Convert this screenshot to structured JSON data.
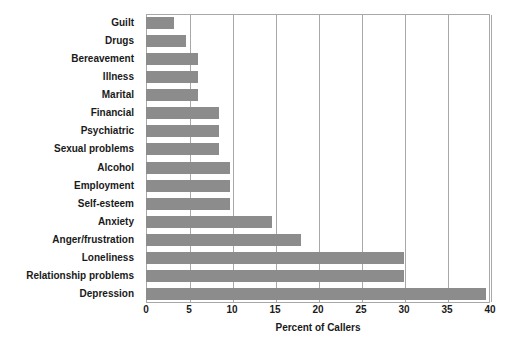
{
  "chart_data": {
    "type": "bar",
    "orientation": "horizontal",
    "title": "",
    "xlabel": "Percent of Callers",
    "ylabel": "",
    "xlim": [
      0,
      40
    ],
    "xticks": [
      0,
      5,
      10,
      15,
      20,
      25,
      30,
      35,
      40
    ],
    "grid": "vertical",
    "legend": "none",
    "bar_color": "#8c8c8c",
    "categories": [
      "Guilt",
      "Drugs",
      "Bereavement",
      "Illness",
      "Marital",
      "Financial",
      "Psychiatric",
      "Sexual problems",
      "Alcohol",
      "Employment",
      "Self-esteem",
      "Anxiety",
      "Anger/frustration",
      "Loneliness",
      "Relationship problems",
      "Depression"
    ],
    "values": [
      3.3,
      4.7,
      6.0,
      6.0,
      6.0,
      8.5,
      8.5,
      8.5,
      9.8,
      9.8,
      9.8,
      14.7,
      18.0,
      30.0,
      30.0,
      39.5
    ]
  }
}
